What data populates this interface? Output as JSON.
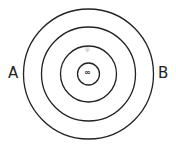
{
  "diagram": {
    "type": "concentric-circles",
    "center": {
      "x": 88.5,
      "y": 74
    },
    "stroke_color": "#222222",
    "rings": [
      {
        "name": "outer-ring",
        "radius": 65
      },
      {
        "name": "second-ring",
        "radius": 47
      },
      {
        "name": "third-ring",
        "radius": 28
      },
      {
        "name": "inner-ring",
        "radius": 11
      }
    ],
    "labels": {
      "left": "A",
      "right": "B"
    },
    "faint_mark": "ψ",
    "center_mark": "∞"
  }
}
